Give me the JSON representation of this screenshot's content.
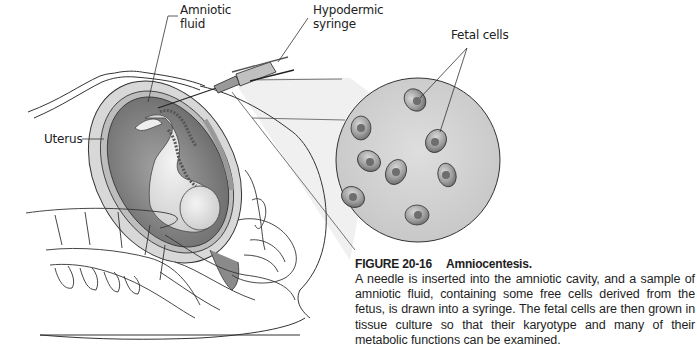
{
  "figure": {
    "labels": {
      "amniotic_fluid_line1": "Amniotic",
      "amniotic_fluid_line2": "fluid",
      "syringe_line1": "Hypodermic",
      "syringe_line2": "syringe",
      "fetal_cells": "Fetal cells",
      "uterus": "Uterus"
    },
    "colors": {
      "circle_fill": "#d4d4d4",
      "cell_fill": "#9a9a9a",
      "nucleus_fill": "#6e6e6e",
      "uterus_wall": "#c8c8c8",
      "amniotic_cavity": "#8a8a8a",
      "line": "#333333"
    }
  },
  "caption": {
    "figure_number": "FIGURE 20-16",
    "title": "Amniocentesis.",
    "body": "A needle is inserted into the amniotic cavity, and a sample of amniotic fluid, containing some free cells derived from the fetus, is drawn into a syringe. The fetal cells are then grown in tissue culture so that their karyotype and many of their metabolic functions can be examined."
  }
}
